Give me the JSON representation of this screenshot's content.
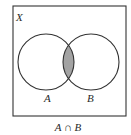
{
  "diagram": {
    "type": "venn",
    "universe_label": "X",
    "sets": [
      {
        "label": "A",
        "cx": 46,
        "cy": 62,
        "r": 28
      },
      {
        "label": "B",
        "cx": 91,
        "cy": 62,
        "r": 28
      }
    ],
    "shaded_region": "intersection",
    "caption": "A ∩ B",
    "colors": {
      "stroke": "#333333",
      "shade": "#a3a3a3",
      "background": "#ffffff"
    }
  }
}
